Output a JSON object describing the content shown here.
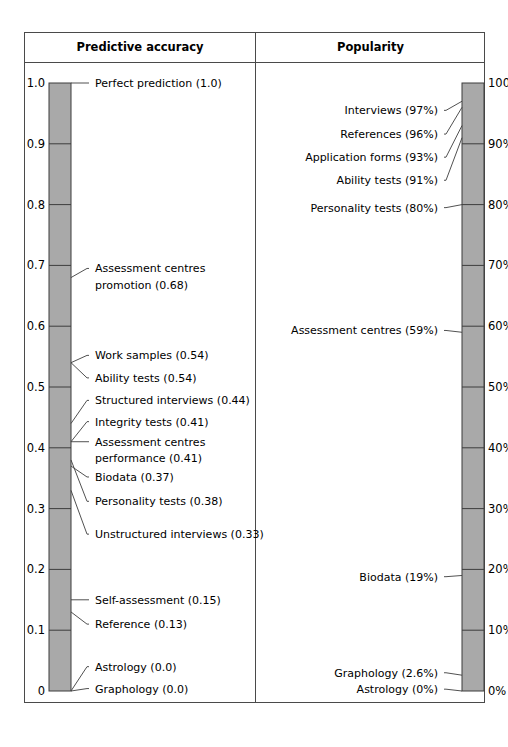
{
  "figure": {
    "columns": [
      {
        "id": "predictive-accuracy",
        "title": "Predictive accuracy"
      },
      {
        "id": "popularity",
        "title": "Popularity"
      }
    ]
  },
  "chart_data": [
    {
      "type": "bar",
      "title": "Predictive accuracy",
      "xlabel": "",
      "ylabel": "",
      "ylim": [
        0,
        1.0
      ],
      "grid": false,
      "legend": "none",
      "orientation": "vertical-scale",
      "axis_ticks": [
        "0",
        "0.1",
        "0.2",
        "0.3",
        "0.4",
        "0.5",
        "0.6",
        "0.7",
        "0.8",
        "0.9",
        "1.0"
      ],
      "axis_tick_values": [
        0,
        0.1,
        0.2,
        0.3,
        0.4,
        0.5,
        0.6,
        0.7,
        0.8,
        0.9,
        1.0
      ],
      "categories": [
        "Perfect prediction",
        "Assessment centres promotion",
        "Work samples",
        "Ability tests",
        "Structured interviews",
        "Integrity tests",
        "Assessment centres performance",
        "Biodata",
        "Personality tests",
        "Unstructured interviews",
        "Self-assessment",
        "Reference",
        "Astrology",
        "Graphology"
      ],
      "values": [
        1.0,
        0.68,
        0.54,
        0.54,
        0.44,
        0.41,
        0.41,
        0.37,
        0.38,
        0.33,
        0.15,
        0.13,
        0.0,
        0.0
      ],
      "annotations": [
        {
          "text": "Perfect prediction (1.0)",
          "value": 1.0,
          "label_y": 1.0
        },
        {
          "text": "Assessment centres",
          "value": 0.68,
          "label_y": 0.695
        },
        {
          "text": "promotion (0.68)",
          "value": 0.68,
          "label_y": 0.668,
          "continuation": true
        },
        {
          "text": "Work samples (0.54)",
          "value": 0.54,
          "label_y": 0.552
        },
        {
          "text": "Ability tests (0.54)",
          "value": 0.54,
          "label_y": 0.515
        },
        {
          "text": "Structured interviews (0.44)",
          "value": 0.44,
          "label_y": 0.478
        },
        {
          "text": "Integrity tests (0.41)",
          "value": 0.41,
          "label_y": 0.443
        },
        {
          "text": "Assessment centres",
          "value": 0.41,
          "label_y": 0.41
        },
        {
          "text": "performance (0.41)",
          "value": 0.41,
          "label_y": 0.384,
          "continuation": true
        },
        {
          "text": "Biodata (0.37)",
          "value": 0.37,
          "label_y": 0.352
        },
        {
          "text": "Personality tests (0.38)",
          "value": 0.38,
          "label_y": 0.312
        },
        {
          "text": "Unstructured interviews (0.33)",
          "value": 0.33,
          "label_y": 0.258
        },
        {
          "text": "Self-assessment (0.15)",
          "value": 0.15,
          "label_y": 0.15
        },
        {
          "text": "Reference (0.13)",
          "value": 0.13,
          "label_y": 0.11
        },
        {
          "text": "Astrology (0.0)",
          "value": 0.0,
          "label_y": 0.04
        },
        {
          "text": "Graphology (0.0)",
          "value": 0.0,
          "label_y": 0.004
        }
      ]
    },
    {
      "type": "bar",
      "title": "Popularity",
      "xlabel": "",
      "ylabel": "",
      "ylim": [
        0,
        100
      ],
      "grid": false,
      "legend": "none",
      "orientation": "vertical-scale",
      "axis_ticks": [
        "0%",
        "10%",
        "20%",
        "30%",
        "40%",
        "50%",
        "60%",
        "70%",
        "80%",
        "90%",
        "100%"
      ],
      "axis_tick_values": [
        0,
        10,
        20,
        30,
        40,
        50,
        60,
        70,
        80,
        90,
        100
      ],
      "categories": [
        "Interviews",
        "References",
        "Application forms",
        "Ability tests",
        "Personality tests",
        "Assessment centres",
        "Biodata",
        "Graphology",
        "Astrology"
      ],
      "values": [
        97,
        96,
        93,
        91,
        80,
        59,
        19,
        2.6,
        0
      ],
      "annotations": [
        {
          "text": "Interviews (97%)",
          "value": 97,
          "label_y": 95.5
        },
        {
          "text": "References (96%)",
          "value": 96,
          "label_y": 91.6
        },
        {
          "text": "Application forms (93%)",
          "value": 93,
          "label_y": 87.8
        },
        {
          "text": "Ability tests (91%)",
          "value": 91,
          "label_y": 84.0
        },
        {
          "text": "Personality tests (80%)",
          "value": 80,
          "label_y": 79.5
        },
        {
          "text": "Assessment centres (59%)",
          "value": 59,
          "label_y": 59.3
        },
        {
          "text": "Biodata (19%)",
          "value": 19,
          "label_y": 18.8
        },
        {
          "text": "Graphology (2.6%)",
          "value": 2.6,
          "label_y": 3.0
        },
        {
          "text": "Astrology (0%)",
          "value": 0,
          "label_y": 0.3
        }
      ]
    }
  ],
  "colors": {
    "bar_fill": "#a9a9a9",
    "bar_stroke": "#3d3d3d",
    "frame": "#4a4a4a",
    "text": "#000000"
  }
}
